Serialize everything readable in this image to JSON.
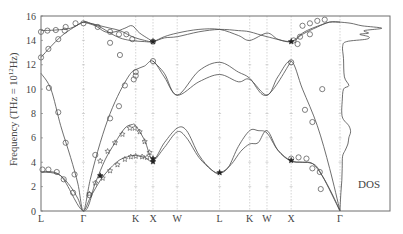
{
  "chart_data": {
    "type": "line",
    "title": "",
    "xlabel": "",
    "ylabel": "Frequency (THz = 10^12 Hz)",
    "ylabel_parts": {
      "prefix": "Frequency (THz = 10",
      "sup": "12",
      "suffix": "Hz)"
    },
    "ylim": [
      0,
      16
    ],
    "yticks": [
      0,
      2,
      4,
      6,
      8,
      10,
      12,
      14,
      16
    ],
    "grid": "vertical dashed lines at high-symmetry points",
    "legend": null,
    "dos_label": "DOS",
    "high_symmetry_points": [
      {
        "label": "L",
        "k": 0.0
      },
      {
        "label": "Γ",
        "k": 0.86
      },
      {
        "label": "K",
        "k": 1.92
      },
      {
        "label": "X",
        "k": 2.27
      },
      {
        "label": "W",
        "k": 2.76
      },
      {
        "label": "L",
        "k": 3.62
      },
      {
        "label": "K",
        "k": 4.23
      },
      {
        "label": "W",
        "k": 4.58
      },
      {
        "label": "X",
        "k": 5.07
      },
      {
        "label": "Γ",
        "k": 6.06
      }
    ],
    "k_range": [
      0,
      6.06
    ],
    "dos_range": [
      6.06,
      7.05
    ],
    "series": [
      {
        "name": "TA1",
        "points": [
          [
            0,
            3.2
          ],
          [
            0.2,
            3.15
          ],
          [
            0.4,
            2.9
          ],
          [
            0.6,
            2.0
          ],
          [
            0.75,
            1.0
          ],
          [
            0.86,
            0
          ],
          [
            1.0,
            1.1
          ],
          [
            1.2,
            2.5
          ],
          [
            1.4,
            3.5
          ],
          [
            1.6,
            4.2
          ],
          [
            1.8,
            4.5
          ],
          [
            1.92,
            4.55
          ],
          [
            2.1,
            4.4
          ],
          [
            2.27,
            4.1
          ],
          [
            2.5,
            5.2
          ],
          [
            2.76,
            6.5
          ],
          [
            2.95,
            6.0
          ],
          [
            3.2,
            4.4
          ],
          [
            3.45,
            3.4
          ],
          [
            3.62,
            3.1
          ],
          [
            3.8,
            3.6
          ],
          [
            4.0,
            5.3
          ],
          [
            4.23,
            6.6
          ],
          [
            4.4,
            6.6
          ],
          [
            4.58,
            6.4
          ],
          [
            4.8,
            5.0
          ],
          [
            5.07,
            4.1
          ],
          [
            5.3,
            4.0
          ],
          [
            5.5,
            3.9
          ],
          [
            5.7,
            2.9
          ],
          [
            5.9,
            1.4
          ],
          [
            6.06,
            0
          ]
        ]
      },
      {
        "name": "TA2",
        "points": [
          [
            0,
            3.2
          ],
          [
            0.4,
            2.9
          ],
          [
            0.86,
            0
          ],
          [
            1.1,
            2.3
          ],
          [
            1.3,
            4.2
          ],
          [
            1.5,
            5.6
          ],
          [
            1.7,
            6.8
          ],
          [
            1.85,
            7.1
          ],
          [
            1.92,
            7.0
          ],
          [
            2.1,
            5.8
          ],
          [
            2.27,
            4.2
          ],
          [
            2.5,
            5.6
          ],
          [
            2.76,
            6.8
          ],
          [
            2.95,
            6.6
          ],
          [
            3.2,
            4.6
          ],
          [
            3.45,
            3.4
          ],
          [
            3.62,
            3.1
          ],
          [
            3.85,
            3.8
          ],
          [
            4.05,
            4.9
          ],
          [
            4.23,
            5.5
          ],
          [
            4.4,
            5.6
          ],
          [
            4.58,
            6.6
          ],
          [
            4.8,
            5.0
          ],
          [
            5.07,
            4.1
          ],
          [
            5.5,
            3.9
          ],
          [
            5.7,
            2.9
          ],
          [
            6.06,
            0
          ]
        ]
      },
      {
        "name": "LA",
        "points": [
          [
            0,
            11.3
          ],
          [
            0.2,
            10.0
          ],
          [
            0.4,
            7.0
          ],
          [
            0.6,
            4.4
          ],
          [
            0.75,
            2.2
          ],
          [
            0.86,
            0
          ],
          [
            1.0,
            2.6
          ],
          [
            1.2,
            5.6
          ],
          [
            1.4,
            8.0
          ],
          [
            1.6,
            9.8
          ],
          [
            1.8,
            11.2
          ],
          [
            1.92,
            11.6
          ],
          [
            2.1,
            11.9
          ],
          [
            2.27,
            12.3
          ],
          [
            2.5,
            11.0
          ],
          [
            2.76,
            9.5
          ],
          [
            3.2,
            10.6
          ],
          [
            3.62,
            11.2
          ],
          [
            4.0,
            10.6
          ],
          [
            4.23,
            10.8
          ],
          [
            4.58,
            9.5
          ],
          [
            4.8,
            11.0
          ],
          [
            5.07,
            12.3
          ],
          [
            5.3,
            10.0
          ],
          [
            5.6,
            7.0
          ],
          [
            5.85,
            3.5
          ],
          [
            6.06,
            0
          ]
        ]
      },
      {
        "name": "LA-upper",
        "points": [
          [
            2.27,
            12.3
          ],
          [
            2.5,
            11.3
          ],
          [
            2.76,
            9.5
          ],
          [
            3.2,
            11.5
          ],
          [
            3.62,
            12.2
          ],
          [
            4.0,
            11.4
          ],
          [
            4.23,
            10.9
          ],
          [
            4.58,
            9.5
          ],
          [
            5.07,
            12.3
          ]
        ]
      },
      {
        "name": "TO1",
        "points": [
          [
            0,
            12.6
          ],
          [
            0.2,
            13.5
          ],
          [
            0.4,
            14.3
          ],
          [
            0.6,
            14.9
          ],
          [
            0.86,
            15.5
          ],
          [
            1.0,
            15.4
          ],
          [
            1.2,
            15.1
          ],
          [
            1.4,
            14.6
          ],
          [
            1.6,
            14.2
          ],
          [
            1.8,
            14.0
          ],
          [
            1.92,
            13.95
          ],
          [
            2.1,
            13.9
          ],
          [
            2.27,
            13.9
          ],
          [
            2.5,
            14.3
          ],
          [
            2.76,
            14.6
          ],
          [
            3.2,
            14.9
          ],
          [
            3.62,
            14.9
          ],
          [
            4.0,
            14.4
          ],
          [
            4.23,
            14.0
          ],
          [
            4.58,
            14.6
          ],
          [
            4.8,
            14.1
          ],
          [
            5.07,
            13.9
          ],
          [
            5.3,
            14.6
          ],
          [
            5.5,
            15.0
          ],
          [
            5.7,
            15.3
          ],
          [
            5.85,
            15.5
          ],
          [
            6.06,
            15.5
          ]
        ]
      },
      {
        "name": "TO2",
        "points": [
          [
            0,
            14.8
          ],
          [
            0.3,
            14.85
          ],
          [
            0.6,
            15.0
          ],
          [
            0.86,
            15.5
          ],
          [
            1.0,
            15.4
          ],
          [
            1.2,
            15.2
          ],
          [
            1.4,
            15.0
          ],
          [
            1.6,
            14.8
          ],
          [
            1.8,
            14.4
          ],
          [
            1.92,
            14.2
          ],
          [
            2.1,
            14.0
          ],
          [
            2.27,
            13.9
          ],
          [
            2.5,
            14.2
          ],
          [
            2.76,
            14.3
          ],
          [
            3.2,
            14.7
          ],
          [
            3.62,
            14.9
          ],
          [
            4.0,
            14.8
          ],
          [
            4.23,
            14.7
          ],
          [
            4.58,
            14.3
          ],
          [
            5.07,
            13.9
          ],
          [
            5.3,
            14.5
          ],
          [
            5.6,
            15.1
          ],
          [
            5.85,
            15.5
          ],
          [
            6.06,
            15.5
          ]
        ]
      },
      {
        "name": "LO",
        "points": [
          [
            0.86,
            15.5
          ],
          [
            1.1,
            15.2
          ],
          [
            1.3,
            14.7
          ],
          [
            1.5,
            14.7
          ],
          [
            1.7,
            15.0
          ],
          [
            1.85,
            15.2
          ],
          [
            2.0,
            14.6
          ],
          [
            2.27,
            13.9
          ]
        ]
      }
    ],
    "dos_curve": [
      [
        15.5,
        0.0
      ],
      [
        15.4,
        0.25
      ],
      [
        15.2,
        0.5
      ],
      [
        15.0,
        0.95
      ],
      [
        14.8,
        0.55
      ],
      [
        14.6,
        0.65
      ],
      [
        14.5,
        0.45
      ],
      [
        14.3,
        0.65
      ],
      [
        14.1,
        0.6
      ],
      [
        13.9,
        0.15
      ],
      [
        13.5,
        0.06
      ],
      [
        12.5,
        0.08
      ],
      [
        11.0,
        0.1
      ],
      [
        10.3,
        0.2
      ],
      [
        10.0,
        0.08
      ],
      [
        9.0,
        0.05
      ],
      [
        8.0,
        0.04
      ],
      [
        7.5,
        0.08
      ],
      [
        7.0,
        0.2
      ],
      [
        6.5,
        0.24
      ],
      [
        6.0,
        0.2
      ],
      [
        5.5,
        0.18
      ],
      [
        5.0,
        0.12
      ],
      [
        4.5,
        0.06
      ],
      [
        3.5,
        0.05
      ],
      [
        2.5,
        0.04
      ],
      [
        1.5,
        0.02
      ],
      [
        0.5,
        0.005
      ],
      [
        0.0,
        0.0
      ]
    ],
    "experimental_circles": [
      [
        0,
        12.6
      ],
      [
        0.15,
        13.3
      ],
      [
        0.35,
        14.1
      ],
      [
        0,
        14.7
      ],
      [
        0.13,
        14.8
      ],
      [
        0.3,
        14.85
      ],
      [
        0.5,
        15.1
      ],
      [
        0.48,
        14.8
      ],
      [
        0.7,
        15.4
      ],
      [
        0.86,
        15.4
      ],
      [
        1.15,
        15.1
      ],
      [
        1.4,
        14.7
      ],
      [
        1.58,
        14.5
      ],
      [
        1.4,
        13.8
      ],
      [
        1.6,
        12.8
      ],
      [
        1.92,
        11.4
      ],
      [
        1.92,
        11.1
      ],
      [
        2.27,
        12.3
      ],
      [
        2.27,
        13.9
      ],
      [
        1.85,
        14.1
      ],
      [
        1.73,
        14.5
      ],
      [
        0.16,
        10.1
      ],
      [
        0.35,
        8.1
      ],
      [
        0.5,
        5.6
      ],
      [
        0.68,
        3.0
      ],
      [
        0.65,
        1.5
      ],
      [
        0.03,
        3.4
      ],
      [
        0.15,
        3.4
      ],
      [
        0.32,
        3.2
      ],
      [
        0.46,
        2.6
      ],
      [
        0.98,
        1.3
      ],
      [
        1.1,
        4.6
      ],
      [
        1.4,
        7.6
      ],
      [
        1.58,
        8.6
      ],
      [
        1.7,
        10.3
      ],
      [
        1.88,
        10.8
      ],
      [
        5.07,
        12.2
      ],
      [
        5.07,
        4.3
      ],
      [
        5.22,
        4.4
      ],
      [
        5.38,
        4.3
      ],
      [
        5.5,
        3.5
      ],
      [
        5.65,
        3.2
      ],
      [
        5.67,
        1.8
      ],
      [
        5.3,
        15.2
      ],
      [
        5.45,
        15.4
      ],
      [
        5.6,
        15.6
      ],
      [
        5.75,
        15.7
      ],
      [
        5.12,
        14.0
      ],
      [
        5.25,
        14.3
      ],
      [
        5.45,
        14.5
      ],
      [
        5.2,
        13.7
      ],
      [
        5.7,
        10.0
      ],
      [
        5.5,
        7.3
      ],
      [
        5.35,
        8.3
      ]
    ],
    "experimental_stars": [
      [
        0.98,
        1.4
      ],
      [
        1.1,
        2.3
      ],
      [
        1.25,
        2.7
      ],
      [
        1.4,
        3.3
      ],
      [
        1.55,
        3.8
      ],
      [
        1.7,
        4.25
      ],
      [
        1.82,
        4.45
      ],
      [
        1.92,
        4.5
      ],
      [
        2.05,
        4.45
      ],
      [
        2.15,
        4.4
      ],
      [
        1.2,
        4.1
      ],
      [
        1.35,
        4.9
      ],
      [
        1.5,
        5.6
      ],
      [
        1.65,
        6.3
      ],
      [
        1.8,
        6.8
      ],
      [
        1.9,
        6.8
      ],
      [
        2.0,
        6.5
      ],
      [
        2.1,
        5.7
      ],
      [
        2.2,
        4.8
      ]
    ],
    "experimental_filled_stars": [
      [
        1.2,
        2.9
      ],
      [
        2.27,
        4.3
      ],
      [
        2.27,
        4.05
      ],
      [
        3.62,
        3.15
      ],
      [
        5.07,
        4.15
      ],
      [
        2.27,
        13.9
      ],
      [
        5.07,
        13.9
      ]
    ],
    "axis_tick_labels_x": [
      "L",
      "Γ",
      "K",
      "X",
      "W",
      "L",
      "K",
      "W",
      "X",
      "Γ"
    ]
  },
  "colors": {
    "line": "#4a4a4a",
    "frame": "#6e6e6e",
    "grid": "#b8b8b8",
    "text": "#444444"
  }
}
